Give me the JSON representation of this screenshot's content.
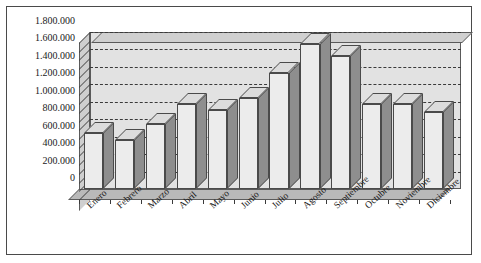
{
  "chart_data": {
    "type": "bar",
    "title": "",
    "subtitle": "",
    "xlabel": "",
    "ylabel": "",
    "categories": [
      "Enero",
      "Febrero",
      "Marzo",
      "Abril",
      "Mayo",
      "Junio",
      "Julio",
      "Agosto",
      "Septiembre",
      "Octubre",
      "Noviembre",
      "Diciembre"
    ],
    "values": [
      640000,
      560000,
      750000,
      980000,
      910000,
      1040000,
      1330000,
      1660000,
      1530000,
      980000,
      980000,
      880000
    ],
    "series": [
      {
        "name": "",
        "values": [
          640000,
          560000,
          750000,
          980000,
          910000,
          1040000,
          1330000,
          1660000,
          1530000,
          980000,
          980000,
          880000
        ]
      }
    ],
    "ylim": [
      0,
      1800000
    ],
    "ytick_values": [
      0,
      200000,
      400000,
      600000,
      800000,
      1000000,
      1200000,
      1400000,
      1600000,
      1800000
    ],
    "ytick_labels": [
      "0",
      "200.000",
      "400.000",
      "600.000",
      "800.000",
      "1.000.000",
      "1.200.000",
      "1.400.000",
      "1.600.000",
      "1.800.000"
    ],
    "grid": true,
    "gridline_style": "dashed",
    "legend": false,
    "legend_position": "none",
    "style": "3d-column",
    "colors": {
      "bar_front": "#ececec",
      "bar_side": "#8e8e8e",
      "bar_top": "#dcdcdc",
      "plot_background": "#e2e2e2",
      "floor": "#b9b9b9",
      "gridline": "#3a3a3a",
      "axis": "#4a4a4a",
      "frame_border": "#4a4a4a",
      "text": "#1a1a1a",
      "page_background": "#ffffff"
    }
  }
}
